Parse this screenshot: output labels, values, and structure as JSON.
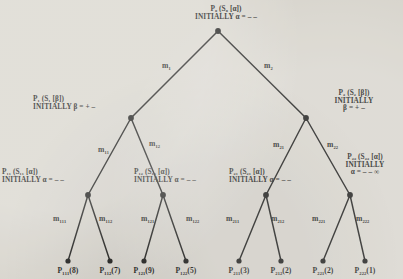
{
  "figure": {
    "type": "binary-game-tree",
    "background_color": "#d8d5cd",
    "ink_color": "#1a1a18"
  },
  "nodes": {
    "root": {
      "line1_p": "P",
      "line1_sub": "0",
      "line1_rest": " (S",
      "line1_sub2": "0",
      "line1_tail": " [α])",
      "line2": "INITIALLY α = – –",
      "full_line1": "P₀ (S₀ [α])",
      "full_line2": "INITIALLY α = – –"
    },
    "p1": {
      "full_line1": "P₁ (S₁ [β])",
      "full_line2": "INITIALLY β = + –"
    },
    "p2": {
      "full_line1": "P₂ (S₂ [β])",
      "full_line2": "INITIALLY",
      "full_line3": "β = + –"
    },
    "p11": {
      "full_line1": "P₁₁ (S₁₁ [α])",
      "full_line2": "INITIALLY α = – –"
    },
    "p12": {
      "full_line1": "P₁₂ (S₁₂ [α])",
      "full_line2": "INITIALLY α = – –"
    },
    "p21": {
      "full_line1": "P₂₁ (S₂₁ [α])",
      "full_line2": "INITIALLY α = – –"
    },
    "p22": {
      "full_line1": "P₂₂ (S₂₂ [α])",
      "full_line2": "INITIALLY",
      "full_line3": "α = – – ∞"
    }
  },
  "edges": {
    "m1": "m₁",
    "m2": "m₂",
    "m11": "m₁₁",
    "m12": "m₁₂",
    "m21": "m₂₁",
    "m22": "m₂₂",
    "m111": "m₁₁₁",
    "m112": "m₁₁₂",
    "m121": "m₁₂₁",
    "m122": "m₁₂₂",
    "m211": "m₂₁₁",
    "m212": "m₂₁₂",
    "m221": "m₂₂₁",
    "m222": "m₂₂₂"
  },
  "leaves": [
    {
      "name": "P₁₁₁",
      "value": "(8)",
      "label": "P₁₁₁(8)"
    },
    {
      "name": "P₁₁₂",
      "value": "(7)",
      "label": "P₁₁₂(7)"
    },
    {
      "name": "P₁₂₁",
      "value": "(9)",
      "label": "P₁₂₁(9)"
    },
    {
      "name": "P₁₂₂",
      "value": "(5)",
      "label": "P₁₂₂(5)"
    },
    {
      "name": "P₂₁₁",
      "value": "(3)",
      "label": "P₂₁₁(3)"
    },
    {
      "name": "P₂₁₂",
      "value": "(2)",
      "label": "P₂₁₂(2)"
    },
    {
      "name": "P₂₂₁",
      "value": "(2)",
      "label": "P₂₂₁(2)"
    },
    {
      "name": "P₂₂₂",
      "value": "(1)",
      "label": "P₂₂₂(1)"
    }
  ]
}
